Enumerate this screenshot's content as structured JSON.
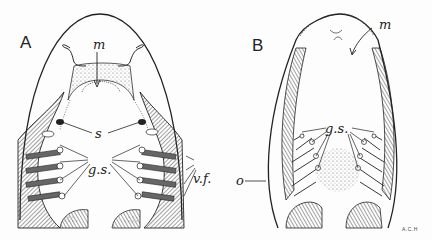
{
  "figure": {
    "panels": [
      {
        "id": "A",
        "label": "A",
        "annotations": {
          "m": "m",
          "s": "s",
          "gs": "g.s.",
          "vf": "v.f."
        }
      },
      {
        "id": "B",
        "label": "B",
        "annotations": {
          "m": "m",
          "gs": "g.s.",
          "o": "o"
        }
      }
    ],
    "signature": "A.C.H"
  }
}
